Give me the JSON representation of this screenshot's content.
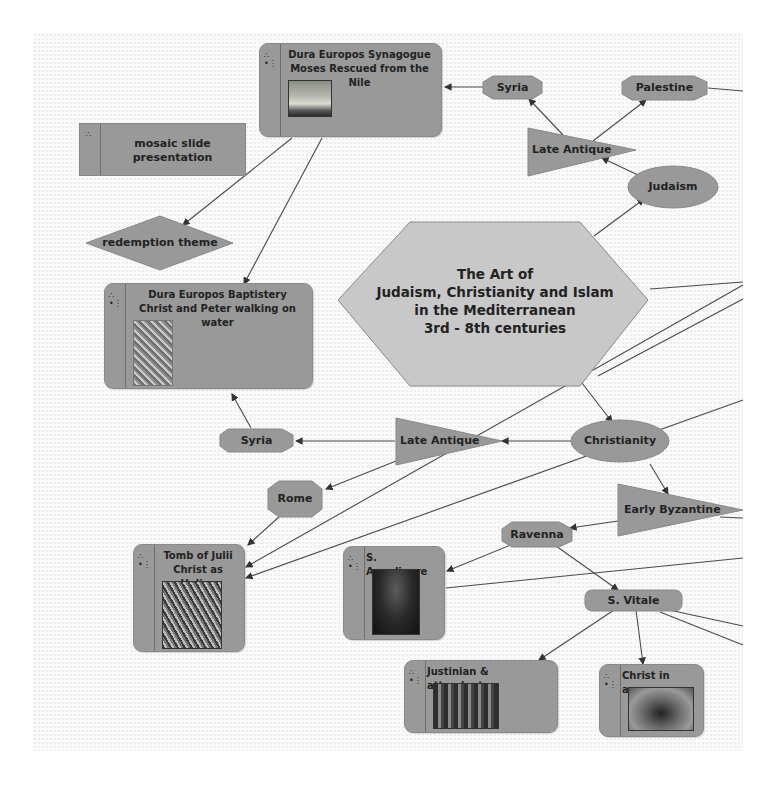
{
  "diagram": {
    "central_topic": {
      "lines": [
        "The Art of",
        "Judaism, Christianity and Islam",
        "in the Mediterranean",
        "3rd - 8th centuries"
      ],
      "shape": "hexagon",
      "fill": "#c8c8c8"
    },
    "nodes": {
      "dura_synagogue": {
        "title_1": "Dura Europos Synagogue",
        "title_2": "Moses Rescued from the Nile",
        "type": "image-card"
      },
      "mosaic_slides": {
        "label": "mosaic slide presentation",
        "type": "document-card"
      },
      "redemption": {
        "label": "redemption theme",
        "shape": "diamond"
      },
      "dura_baptistery": {
        "title_1": "Dura Europos Baptistery",
        "title_2": "Christ and Peter walking on water",
        "type": "image-card"
      },
      "syria_top": {
        "label": "Syria",
        "shape": "octagon"
      },
      "palestine": {
        "label": "Palestine",
        "shape": "octagon"
      },
      "late_antique_top": {
        "label": "Late Antique",
        "shape": "triangle"
      },
      "judaism": {
        "label": "Judaism",
        "shape": "ellipse"
      },
      "syria_mid": {
        "label": "Syria",
        "shape": "octagon"
      },
      "late_antique_mid": {
        "label": "Late Antique",
        "shape": "triangle"
      },
      "christianity": {
        "label": "Christianity",
        "shape": "ellipse"
      },
      "rome": {
        "label": "Rome",
        "shape": "octagon"
      },
      "early_byzantine": {
        "label": "Early Byzantine",
        "shape": "triangle"
      },
      "ravenna": {
        "label": "Ravenna",
        "shape": "octagon"
      },
      "tomb_julii": {
        "title_1": "Tomb of Julii",
        "title_2": "Christ as Helios",
        "type": "image-card"
      },
      "s_appolinare": {
        "title_1": "S. Appolinare",
        "type": "image-card"
      },
      "s_vitale": {
        "label": "S. Vitale",
        "shape": "rounded-rect"
      },
      "justinian": {
        "title_1": "Justinian & attendants",
        "type": "image-card"
      },
      "christ_apse": {
        "title_1": "Christ in apse",
        "type": "image-card"
      }
    },
    "node_icons": {
      "strip_top": "hierarchy-icon",
      "strip_bottom": "info-icon"
    },
    "colors": {
      "node_fill": "#999999",
      "central_fill": "#c8c8c8",
      "edge": "#444444",
      "canvas": "#fafafa"
    }
  }
}
